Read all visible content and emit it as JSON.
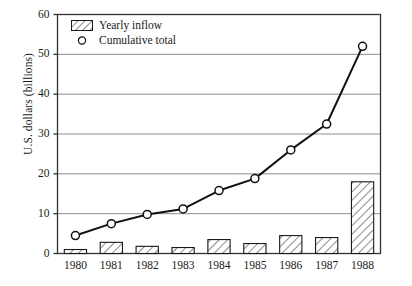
{
  "chart_data": {
    "type": "bar",
    "title": "",
    "subtitle": "",
    "xlabel": "",
    "ylabel": "U.S. dollars (billions)",
    "categories": [
      "1980",
      "1981",
      "1982",
      "1983",
      "1984",
      "1985",
      "1986",
      "1987",
      "1988"
    ],
    "ylim": [
      0,
      60
    ],
    "yticks": [
      0,
      10,
      20,
      30,
      40,
      50,
      60
    ],
    "grid": "horizontal",
    "legend_position": "top-left-inside",
    "series": [
      {
        "name": "Yearly inflow",
        "type": "bar",
        "values": [
          1,
          2.8,
          1.8,
          1.5,
          3.5,
          2.5,
          4.5,
          4,
          18
        ]
      },
      {
        "name": "Cumulative total",
        "type": "line",
        "marker": "open-circle",
        "values": [
          4.5,
          7.5,
          9.8,
          11.2,
          15.8,
          18.8,
          26,
          32.5,
          52
        ]
      }
    ]
  },
  "legend": {
    "items": [
      {
        "label": "Yearly inflow",
        "marker": "hatched-rectangle"
      },
      {
        "label": "Cumulative total",
        "marker": "open-circle"
      }
    ]
  },
  "axes": {
    "y_tick_labels": [
      "0",
      "10",
      "20",
      "30",
      "40",
      "50",
      "60"
    ],
    "x_tick_labels": [
      "1980",
      "1981",
      "1982",
      "1983",
      "1984",
      "1985",
      "1986",
      "1987",
      "1988"
    ],
    "y_axis_title": "U.S. dollars (billions)"
  },
  "style": {
    "line_color": "#111111",
    "bar_edge_color": "#1a1a1a",
    "bar_fill_color": "#ffffff",
    "grid_color": "#8d8d8d",
    "axis_color": "#333333",
    "background": "#ffffff"
  },
  "caption": ""
}
